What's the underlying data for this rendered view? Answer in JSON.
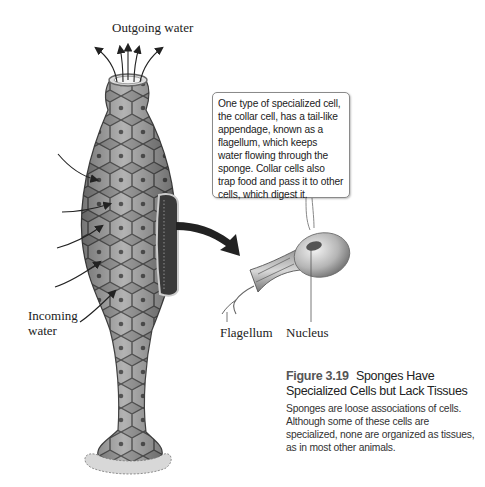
{
  "diagram": {
    "labels": {
      "outgoing_water": "Outgoing water",
      "incoming_water": "Incoming water",
      "incoming_line1": "Incoming",
      "incoming_line2": "water",
      "flagellum": "Flagellum",
      "nucleus": "Nucleus"
    },
    "callout": {
      "text": "One type of specialized cell, the collar cell, has a tail-like appendage, known as a flagellum, which keeps water flowing through the sponge. Collar cells also trap food and pass it to other cells, which digest it."
    },
    "caption": {
      "figure_number": "Figure 3.19",
      "title": "Sponges Have Specialized Cells but Lack Tissues",
      "body": "Sponges are loose associations of cells. Although some of these cells are specialized, none are organized as tissues, as in most other animals."
    },
    "icons": {
      "outgoing_arrows": "arrow-up-icon",
      "incoming_arrows": "arrow-right-icon",
      "pointer_arrow": "curved-arrow-icon"
    },
    "colors": {
      "sponge_body": "#8c8c8c",
      "cell_outline": "#4a4a4a",
      "background": "#ffffff",
      "text": "#222222"
    }
  }
}
